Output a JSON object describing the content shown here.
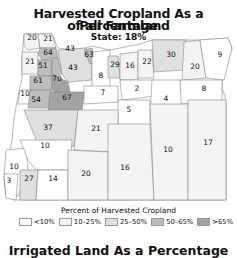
{
  "title_line1": "Harvested Cropland As a Percentage",
  "title_line2": "of all Farmland",
  "subtitle": "State: 18%",
  "legend": {
    "title": "Percent of Harvested Cropland",
    "items": [
      {
        "label": "<10%",
        "color": "#ffffff"
      },
      {
        "label": "10–25%",
        "color": "#f4f4f4"
      },
      {
        "label": "25–50%",
        "color": "#e0e0e0"
      },
      {
        "label": "50–65%",
        "color": "#bdbdbd"
      },
      {
        "label": ">65%",
        "color": "#a3a3a3"
      }
    ]
  },
  "next_title": "Irrigated Land As a Percentage",
  "counties": [
    {
      "value": "20",
      "x": 32,
      "y": 40
    },
    {
      "value": "21",
      "x": 48,
      "y": 41
    },
    {
      "value": "43",
      "x": 70,
      "y": 51
    },
    {
      "value": "64",
      "x": 48,
      "y": 55
    },
    {
      "value": "63",
      "x": 89,
      "y": 57
    },
    {
      "value": "21",
      "x": 30,
      "y": 64
    },
    {
      "value": "51",
      "x": 43,
      "y": 68
    },
    {
      "value": "43",
      "x": 73,
      "y": 70
    },
    {
      "value": "29",
      "x": 115,
      "y": 67
    },
    {
      "value": "16",
      "x": 130,
      "y": 68
    },
    {
      "value": "22",
      "x": 147,
      "y": 64
    },
    {
      "value": "30",
      "x": 171,
      "y": 57
    },
    {
      "value": "9",
      "x": 220,
      "y": 57
    },
    {
      "value": "20",
      "x": 195,
      "y": 69
    },
    {
      "value": "61",
      "x": 38,
      "y": 83
    },
    {
      "value": "70",
      "x": 57,
      "y": 81
    },
    {
      "value": "8",
      "x": 101,
      "y": 78
    },
    {
      "value": "2",
      "x": 137,
      "y": 91
    },
    {
      "value": "8",
      "x": 204,
      "y": 91
    },
    {
      "value": "7",
      "x": 103,
      "y": 95
    },
    {
      "value": "4",
      "x": 166,
      "y": 101
    },
    {
      "value": "10",
      "x": 25,
      "y": 96
    },
    {
      "value": "54",
      "x": 36,
      "y": 102
    },
    {
      "value": "67",
      "x": 67,
      "y": 100
    },
    {
      "value": "5",
      "x": 129,
      "y": 112
    },
    {
      "value": "37",
      "x": 48,
      "y": 130
    },
    {
      "value": "21",
      "x": 96,
      "y": 131
    },
    {
      "value": "10",
      "x": 14,
      "y": 169
    },
    {
      "value": "10",
      "x": 45,
      "y": 148
    },
    {
      "value": "10",
      "x": 168,
      "y": 152
    },
    {
      "value": "17",
      "x": 208,
      "y": 145
    },
    {
      "value": "16",
      "x": 125,
      "y": 170
    },
    {
      "value": "20",
      "x": 86,
      "y": 176
    },
    {
      "value": "14",
      "x": 53,
      "y": 181
    },
    {
      "value": "27",
      "x": 29,
      "y": 181
    },
    {
      "value": "3",
      "x": 9,
      "y": 183
    }
  ]
}
